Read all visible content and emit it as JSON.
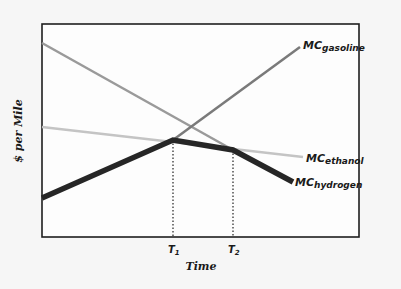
{
  "chart_data": {
    "type": "line",
    "title": "",
    "xlabel": "Time",
    "ylabel": "$ per Mile",
    "x_ticks": [
      {
        "label": "T",
        "sub": "1",
        "x": 173
      },
      {
        "label": "T",
        "sub": "2",
        "x": 233
      }
    ],
    "grid": false,
    "legend": "inline labels at line ends",
    "series": [
      {
        "name": "MC_gasoline",
        "label_main": "MC",
        "label_sub": "gasoline",
        "color": "#7a7a7a",
        "points": [
          [
            173,
            140
          ],
          [
            300,
            47
          ]
        ],
        "description": "Rising line; marginal cost of gasoline increases over time"
      },
      {
        "name": "falling_gray",
        "label_main": "",
        "label_sub": "",
        "color": "#9a9a9a",
        "points": [
          [
            42,
            43
          ],
          [
            233,
            150
          ]
        ],
        "description": "Unlabeled falling gray line from top-left meeting hydrogen at T2"
      },
      {
        "name": "MC_ethanol",
        "label_main": "MC",
        "label_sub": "ethanol",
        "color": "#c4c4c4",
        "points": [
          [
            42,
            127
          ],
          [
            303,
            157
          ]
        ],
        "description": "Gently declining line; marginal cost of ethanol"
      },
      {
        "name": "MC_hydrogen",
        "label_main": "MC",
        "label_sub": "hydrogen",
        "color": "#262626",
        "points": [
          [
            42,
            198
          ],
          [
            173,
            140
          ],
          [
            233,
            150
          ],
          [
            293,
            182
          ]
        ],
        "description": "Rises until T1, slowly declines to T2, then falls steeply"
      }
    ],
    "plot_area": {
      "x0": 42,
      "y0": 24,
      "x1": 359,
      "y1": 237
    }
  }
}
